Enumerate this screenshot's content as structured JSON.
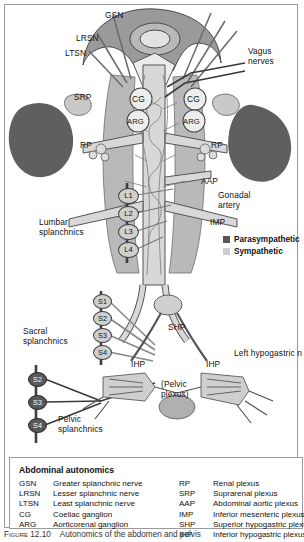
{
  "figure": {
    "caption_number": "Figure 12.10",
    "caption_text": "Autonomics of the abdomen and pelvis"
  },
  "colors": {
    "parasympathetic": "#585858",
    "sympathetic": "#cfcfcf",
    "organ": "#5f5f5f",
    "tissue": "#b9b9b9",
    "vessel": "#d8d8d8",
    "outline": "#4a4a4a"
  },
  "diagram": {
    "labels": [
      {
        "id": "gsn",
        "text": "GSN",
        "x": 100,
        "y": 6,
        "align": "left"
      },
      {
        "id": "lrsn",
        "text": "LRSN",
        "x": 71,
        "y": 29,
        "align": "left"
      },
      {
        "id": "ltsn",
        "text": "LTSN",
        "x": 60,
        "y": 44,
        "align": "left"
      },
      {
        "id": "vagus-nerves",
        "text": "Vagus\nnerves",
        "x": 243,
        "y": 42,
        "align": "left"
      },
      {
        "id": "srp",
        "text": "SRP",
        "x": 69,
        "y": 88,
        "align": "left"
      },
      {
        "id": "rp-left-upper",
        "text": "RP",
        "x": 75,
        "y": 136,
        "align": "left"
      },
      {
        "id": "rp-right-upper",
        "text": "RP",
        "x": 206,
        "y": 136,
        "align": "left"
      },
      {
        "id": "cg-left",
        "text": "CG",
        "x": 127,
        "y": 91,
        "align": "left"
      },
      {
        "id": "cg-right",
        "text": "CG",
        "x": 182,
        "y": 91,
        "align": "left"
      },
      {
        "id": "arg-left",
        "text": "ARG",
        "x": 122,
        "y": 113,
        "align": "left"
      },
      {
        "id": "arg-right",
        "text": "ARG",
        "x": 177,
        "y": 113,
        "align": "left"
      },
      {
        "id": "aap",
        "text": "AAP",
        "x": 196,
        "y": 172,
        "align": "left"
      },
      {
        "id": "gonadal-artery",
        "text": "Gonadal\nartery",
        "x": 213,
        "y": 186,
        "align": "left"
      },
      {
        "id": "imp",
        "text": "IMP",
        "x": 205,
        "y": 213,
        "align": "left"
      },
      {
        "id": "lumbar-splanchnics",
        "text": "Lumbar\nsplanchnics",
        "x": 37,
        "y": 213,
        "align": "left"
      },
      {
        "id": "sacral-splanchnics",
        "text": "Sacral\nsplanchnics",
        "x": 21,
        "y": 322,
        "align": "left"
      },
      {
        "id": "pelvic-splanchnics",
        "text": "Pelvic\nsplanchnics",
        "x": 53,
        "y": 413,
        "align": "left"
      },
      {
        "id": "shp",
        "text": "SHP",
        "x": 163,
        "y": 320,
        "align": "left"
      },
      {
        "id": "left-hypogastric-n",
        "text": "Left hypogastric n",
        "x": 229,
        "y": 344,
        "align": "left"
      },
      {
        "id": "ihp-left",
        "text": "IHP",
        "x": 128,
        "y": 355,
        "align": "left"
      },
      {
        "id": "ihp-right",
        "text": "IHP",
        "x": 201,
        "y": 355,
        "align": "left"
      },
      {
        "id": "pelvic-plexus",
        "text": "(Pelvic\nplexus)",
        "x": 156,
        "y": 375,
        "align": "left"
      }
    ],
    "ganglia_lumbar": [
      {
        "label": "L1",
        "x": 122,
        "y": 190
      },
      {
        "label": "L2",
        "x": 122,
        "y": 208
      },
      {
        "label": "L3",
        "x": 122,
        "y": 226
      },
      {
        "label": "L4",
        "x": 122,
        "y": 244
      }
    ],
    "ganglia_sacral": [
      {
        "label": "S1",
        "x": 96,
        "y": 296,
        "type": "sympathetic"
      },
      {
        "label": "S2",
        "x": 96,
        "y": 313,
        "type": "sympathetic"
      },
      {
        "label": "S3",
        "x": 96,
        "y": 330,
        "type": "sympathetic"
      },
      {
        "label": "S4",
        "x": 96,
        "y": 347,
        "type": "sympathetic"
      }
    ],
    "ganglia_pelvic": [
      {
        "label": "S2",
        "x": 31,
        "y": 374,
        "type": "parasympathetic"
      },
      {
        "label": "S3",
        "x": 31,
        "y": 397,
        "type": "parasympathetic"
      },
      {
        "label": "S4",
        "x": 31,
        "y": 420,
        "type": "parasympathetic"
      }
    ]
  },
  "key": {
    "items": [
      {
        "label": "Parasympathetic",
        "color": "#585858"
      },
      {
        "label": "Sympathetic",
        "color": "#cfcfcf"
      }
    ]
  },
  "legend": {
    "title": "Abdominal autonomics",
    "left": [
      {
        "abbr": "GSN",
        "desc": "Greater splanchnic nerve"
      },
      {
        "abbr": "LRSN",
        "desc": "Lesser splanchnic nerve"
      },
      {
        "abbr": "LTSN",
        "desc": "Least splanchnic nerve"
      },
      {
        "abbr": "CG",
        "desc": "Coeliac ganglion"
      },
      {
        "abbr": "ARG",
        "desc": "Aorticorenal ganglion"
      }
    ],
    "right": [
      {
        "abbr": "RP",
        "desc": "Renal plexus"
      },
      {
        "abbr": "SRP",
        "desc": "Suprarenal plexus"
      },
      {
        "abbr": "AAP",
        "desc": "Abdominal aortic plexus"
      },
      {
        "abbr": "IMP",
        "desc": "Inferior mesenteric plexus"
      },
      {
        "abbr": "SHP",
        "desc": "Superior hypogastric plexus"
      },
      {
        "abbr": "IHP",
        "desc": "Inferior hypogastric plexus"
      }
    ]
  }
}
